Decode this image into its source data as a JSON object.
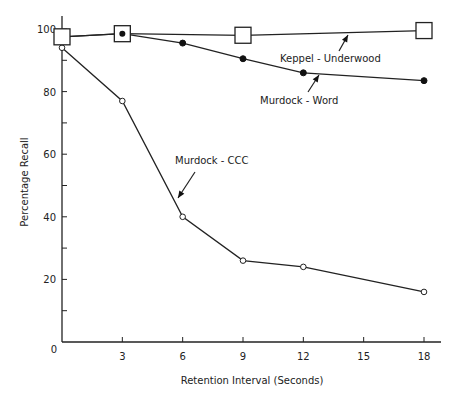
{
  "chart_data": {
    "type": "line",
    "title": "",
    "xlabel": "Retention Interval (Seconds)",
    "ylabel": "Percentage Recall",
    "xlim": [
      0,
      19
    ],
    "ylim": [
      0,
      105
    ],
    "x_ticks": [
      3,
      6,
      9,
      12,
      15,
      18
    ],
    "x_tick_labels": [
      "3",
      "6",
      "9",
      "12",
      "15",
      "18"
    ],
    "y_ticks_major": [
      0,
      20,
      40,
      60,
      80,
      100
    ],
    "y_tick_labels": [
      "0",
      "20",
      "40",
      "60",
      "80",
      "100"
    ],
    "y_ticks_minor": [
      10,
      30,
      50,
      70,
      90
    ],
    "grid": false,
    "legend": "none (series identified by arrow annotations)",
    "series": [
      {
        "name": "Keppel - Underwood",
        "marker": "open-square",
        "x": [
          0,
          3,
          9,
          18
        ],
        "values": [
          97.5,
          98.5,
          98,
          99.5
        ]
      },
      {
        "name": "Murdock - Word",
        "marker": "filled-circle",
        "x": [
          0,
          3,
          6,
          9,
          12,
          18
        ],
        "values": [
          97.5,
          98.5,
          95.5,
          90.5,
          86,
          83.5
        ]
      },
      {
        "name": "Murdock - CCC",
        "marker": "open-circle",
        "x": [
          0,
          3,
          6,
          9,
          12,
          18
        ],
        "values": [
          94,
          77,
          40,
          26,
          24,
          16
        ]
      }
    ],
    "annotations": [
      {
        "text": "Keppel - Underwood",
        "arrow_to_series": "Keppel - Underwood"
      },
      {
        "text": "Murdock - Word",
        "arrow_to_series": "Murdock - Word"
      },
      {
        "text": "Murdock - CCC",
        "arrow_to_series": "Murdock - CCC"
      }
    ]
  }
}
